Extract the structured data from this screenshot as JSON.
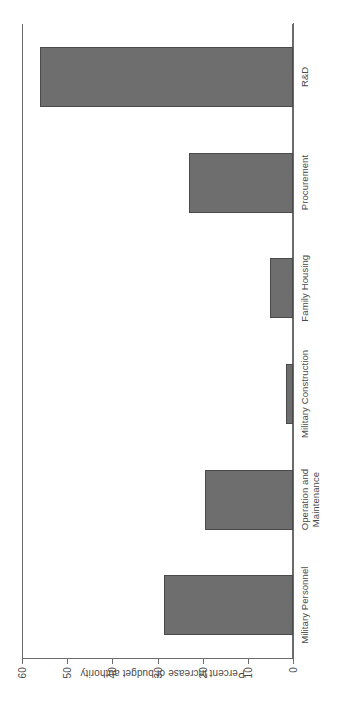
{
  "chart_data": {
    "type": "bar",
    "title": "",
    "xlabel": "",
    "ylabel": "Percent increase of budget authority",
    "categories": [
      "Military Personnel",
      "Operation and\nMaintenance",
      "Military Construction",
      "Family Housing",
      "Procurement",
      "R&D"
    ],
    "values": [
      28.5,
      19.5,
      1.5,
      5.0,
      23.0,
      56.0
    ],
    "ylim": [
      0,
      60
    ],
    "yticks": [
      0,
      10,
      20,
      30,
      40,
      50,
      60
    ],
    "ytick_labels": [
      "0",
      "10",
      "20",
      "30",
      "40",
      "50",
      "60"
    ],
    "grid": false,
    "legend": false,
    "bar_color": "#6e6e6e",
    "bar_edge_color": "#4a4a4a",
    "axis_color": "#6b6b6b",
    "background": "#ffffff",
    "orientation": "rotated-90-ccw"
  },
  "axis": {
    "y_title": "Percent increase of budget authority"
  },
  "categories": {
    "c0": "Military Personnel",
    "c1_line1": "Operation and",
    "c1_line2": "Maintenance",
    "c2": "Military Construction",
    "c3": "Family Housing",
    "c4": "Procurement",
    "c5": "R&D"
  },
  "ticks": {
    "t0": "0",
    "t10": "10",
    "t20": "20",
    "t30": "30",
    "t40": "40",
    "t50": "50",
    "t60": "60"
  }
}
